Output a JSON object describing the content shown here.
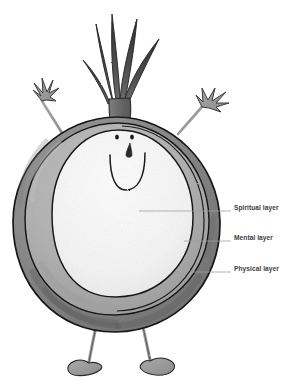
{
  "diagram": {
    "palette": {
      "outline": "#1a1a1a",
      "outer_layer_fill": "#8e8e8e",
      "outer_layer_shade": "#6f6f6f",
      "middle_layer_fill": "#b4b4b4",
      "middle_layer_shade": "#a0a0a0",
      "inner_layer_fill": "#f4f4f4",
      "limb_fill": "#9a9a9a",
      "sprout_fill": "#4a4a4a",
      "label_text": "#3d3d3d",
      "leader_line": "#9b9b9b",
      "background": "#ffffff"
    },
    "labels": [
      {
        "id": "spiritual",
        "text": "Spiritual layer",
        "target": "inner-core"
      },
      {
        "id": "mental",
        "text": "Mental layer",
        "target": "middle-ring"
      },
      {
        "id": "physical",
        "text": "Physical layer",
        "target": "outer-ring"
      }
    ],
    "character": {
      "face": {
        "eyes": 2,
        "nose": "teardrop",
        "mouth": "smile"
      },
      "sprout_leaves": 5,
      "arms": 2,
      "hands": "splayed-fingers",
      "legs": 2,
      "feet": 2
    }
  }
}
